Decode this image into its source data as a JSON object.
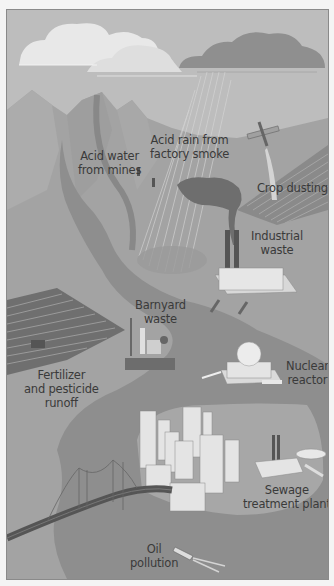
{
  "diagram": {
    "type": "illustration",
    "colors": {
      "sky": "#bdbdbd",
      "mountains": "#a6a6a6",
      "land": "#9c9c9c",
      "river": "#8d8d8d",
      "city_ground": "#a9a9a9",
      "cloud_light": "#e6e6e6",
      "cloud_dark": "#8e8e8e",
      "text": "#3a3a3a"
    },
    "labels": {
      "acid_water": {
        "line1": "Acid water",
        "line2": "from mines"
      },
      "acid_rain": {
        "line1": "Acid rain from",
        "line2": "factory smoke"
      },
      "crop_dusting": {
        "line1": "Crop dusting"
      },
      "industrial_waste": {
        "line1": "Industrial",
        "line2": "waste"
      },
      "barnyard_waste": {
        "line1": "Barnyard",
        "line2": "waste"
      },
      "fertilizer": {
        "line1": "Fertilizer",
        "line2": "and pesticide",
        "line3": "runoff"
      },
      "nuclear_reactor": {
        "line1": "Nuclear",
        "line2": "reactor"
      },
      "sewage": {
        "line1": "Sewage",
        "line2": "treatment plant"
      },
      "oil_pollution": {
        "line1": "Oil",
        "line2": "pollution"
      }
    }
  }
}
